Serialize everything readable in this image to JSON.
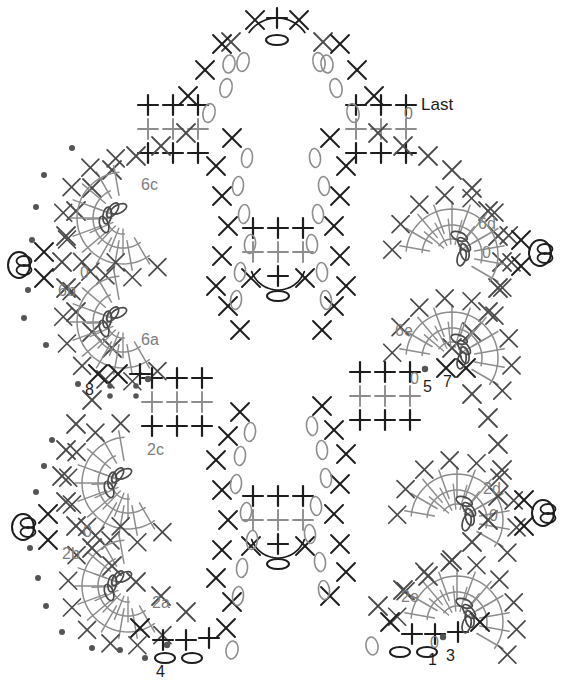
{
  "document": {
    "title": "Crochet Symbol Chart",
    "type": "crochet-pattern-diagram",
    "width": 565,
    "height": 700,
    "background_color": "#ffffff"
  },
  "colors": {
    "stitch_dark": "#1d1d1d",
    "stitch_mid": "#4a4a4a",
    "stitch_light": "#8d8d8d",
    "label_gray": "#7d7d7d",
    "label_black": "#1d1d1d",
    "marker_dot": "#555555"
  },
  "legend_symbols": [
    {
      "name": "x-stitch",
      "glyph": "X",
      "meaning": "single crochet"
    },
    {
      "name": "plus-stitch",
      "glyph": "+",
      "meaning": "slip stitch / sc"
    },
    {
      "name": "oval-chain",
      "glyph": "0",
      "meaning": "chain stitch"
    },
    {
      "name": "dot-marker",
      "glyph": "•",
      "meaning": "marker"
    },
    {
      "name": "ring-loop",
      "glyph": "⊘",
      "meaning": "loop / magic ring"
    }
  ],
  "labels": [
    {
      "id": "last",
      "text": "Last",
      "x": 421,
      "y": 110,
      "color": "black",
      "size": 17
    },
    {
      "id": "l6c",
      "text": "6c",
      "x": 141,
      "y": 190,
      "color": "gray",
      "size": 16
    },
    {
      "id": "l6b",
      "text": "6b",
      "x": 58,
      "y": 296,
      "color": "gray",
      "size": 16
    },
    {
      "id": "l6a",
      "text": "6a",
      "x": 141,
      "y": 345,
      "color": "gray",
      "size": 16
    },
    {
      "id": "l6d",
      "text": "6d",
      "x": 478,
      "y": 229,
      "color": "gray",
      "size": 16
    },
    {
      "id": "l6e",
      "text": "6e",
      "x": 395,
      "y": 336,
      "color": "gray",
      "size": 16
    },
    {
      "id": "l2c",
      "text": "2c",
      "x": 147,
      "y": 455,
      "color": "gray",
      "size": 16
    },
    {
      "id": "l2b",
      "text": "2b",
      "x": 62,
      "y": 559,
      "color": "gray",
      "size": 16
    },
    {
      "id": "l2a",
      "text": "2a",
      "x": 152,
      "y": 608,
      "color": "gray",
      "size": 16
    },
    {
      "id": "l2d",
      "text": "2d",
      "x": 483,
      "y": 494,
      "color": "gray",
      "size": 16
    },
    {
      "id": "l2e",
      "text": "2e",
      "x": 401,
      "y": 602,
      "color": "gray",
      "size": 16
    },
    {
      "id": "n0_top",
      "text": "0",
      "x": 404,
      "y": 119,
      "color": "gray",
      "size": 16
    },
    {
      "id": "n0_left_up",
      "text": "0",
      "x": 80,
      "y": 278,
      "color": "gray",
      "size": 16
    },
    {
      "id": "n0_right_up",
      "text": "0",
      "x": 482,
      "y": 258,
      "color": "gray",
      "size": 16
    },
    {
      "id": "n0_mid",
      "text": "0",
      "x": 410,
      "y": 384,
      "color": "gray",
      "size": 16
    },
    {
      "id": "n5",
      "text": "5",
      "x": 423,
      "y": 392,
      "color": "black",
      "size": 16
    },
    {
      "id": "n7",
      "text": "7",
      "x": 443,
      "y": 387,
      "color": "black",
      "size": 16
    },
    {
      "id": "n8",
      "text": "8",
      "x": 85,
      "y": 395,
      "color": "black",
      "size": 16
    },
    {
      "id": "n0_left_lo",
      "text": "0",
      "x": 83,
      "y": 537,
      "color": "gray",
      "size": 16
    },
    {
      "id": "n0_right_lo",
      "text": "0",
      "x": 489,
      "y": 521,
      "color": "gray",
      "size": 16
    },
    {
      "id": "n0_bot",
      "text": "0",
      "x": 430,
      "y": 648,
      "color": "gray",
      "size": 16
    },
    {
      "id": "n1",
      "text": "1",
      "x": 428,
      "y": 665,
      "color": "black",
      "size": 16
    },
    {
      "id": "n3",
      "text": "3",
      "x": 446,
      "y": 661,
      "color": "black",
      "size": 16
    },
    {
      "id": "n4",
      "text": "4",
      "x": 156,
      "y": 677,
      "color": "black",
      "size": 16
    }
  ],
  "spiral_motifs": [
    {
      "id": "6c",
      "cx": 123,
      "cy": 218,
      "rot": 205,
      "scale": 1.0
    },
    {
      "id": "6a",
      "cx": 123,
      "cy": 322,
      "rot": 205,
      "scale": 1.0
    },
    {
      "id": "6d",
      "cx": 452,
      "cy": 255,
      "rot": 335,
      "scale": 1.0
    },
    {
      "id": "6e",
      "cx": 452,
      "cy": 358,
      "rot": 335,
      "scale": 1.0
    },
    {
      "id": "2c",
      "cx": 128,
      "cy": 483,
      "rot": 205,
      "scale": 1.0
    },
    {
      "id": "2a",
      "cx": 128,
      "cy": 586,
      "rot": 205,
      "scale": 1.0
    },
    {
      "id": "2d",
      "cx": 457,
      "cy": 520,
      "rot": 335,
      "scale": 1.0
    },
    {
      "id": "2e",
      "cx": 457,
      "cy": 622,
      "rot": 335,
      "scale": 1.0
    }
  ],
  "center_blocks": [
    {
      "id": "center-top",
      "x": 253,
      "y": 228,
      "rows": 2,
      "cols": 3
    },
    {
      "id": "center-bottom",
      "x": 253,
      "y": 496,
      "rows": 2,
      "cols": 3
    }
  ],
  "corner_blocks": [
    {
      "id": "block-top-left",
      "x": 148,
      "y": 98
    },
    {
      "id": "block-top-right",
      "x": 356,
      "y": 98
    },
    {
      "id": "block-mid-left",
      "x": 152,
      "y": 375
    },
    {
      "id": "block-mid-right",
      "x": 360,
      "y": 368
    }
  ],
  "edge_rings": [
    {
      "id": "ring-left-upper",
      "x": 22,
      "y": 265
    },
    {
      "id": "ring-left-lower",
      "x": 26,
      "y": 527
    },
    {
      "id": "ring-right-upper",
      "x": 543,
      "y": 253
    },
    {
      "id": "ring-right-lower",
      "x": 546,
      "y": 513
    }
  ],
  "apex": {
    "id": "top-peak",
    "x": 277,
    "y": 18
  },
  "nadir": {
    "id": "bottom-anchor-left",
    "x": 178,
    "y": 648
  }
}
